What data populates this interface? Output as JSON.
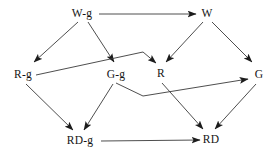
{
  "diagram": {
    "type": "directed-graph",
    "title": "",
    "background_color": "#ffffff",
    "edge_color": "#3a3a3a",
    "text_color": "#141414",
    "nodes": [
      {
        "id": "W-g",
        "label": "W-g",
        "x": 82,
        "y": 14,
        "row": "top"
      },
      {
        "id": "W",
        "label": "W",
        "x": 207,
        "y": 14,
        "row": "top"
      },
      {
        "id": "R-g",
        "label": "R-g",
        "x": 23,
        "y": 75,
        "row": "middle"
      },
      {
        "id": "G-g",
        "label": "G-g",
        "x": 116,
        "y": 75,
        "row": "middle"
      },
      {
        "id": "R",
        "label": "R",
        "x": 161,
        "y": 74,
        "row": "middle"
      },
      {
        "id": "G",
        "label": "G",
        "x": 259,
        "y": 75,
        "row": "middle"
      },
      {
        "id": "RD-g",
        "label": "RD-g",
        "x": 80,
        "y": 141,
        "row": "bottom"
      },
      {
        "id": "RD",
        "label": "RD",
        "x": 211,
        "y": 140,
        "row": "bottom"
      }
    ],
    "edges": [
      {
        "from": "W-g",
        "to": "W",
        "shape": "straight"
      },
      {
        "from": "W-g",
        "to": "R-g",
        "shape": "straight"
      },
      {
        "from": "W-g",
        "to": "G-g",
        "shape": "straight"
      },
      {
        "from": "W",
        "to": "R",
        "shape": "straight"
      },
      {
        "from": "W",
        "to": "G",
        "shape": "straight"
      },
      {
        "from": "R-g",
        "to": "R",
        "shape": "bent-over-peak"
      },
      {
        "from": "G-g",
        "to": "G",
        "shape": "bent-under-valley"
      },
      {
        "from": "R-g",
        "to": "RD-g",
        "shape": "straight"
      },
      {
        "from": "G-g",
        "to": "RD-g",
        "shape": "straight"
      },
      {
        "from": "R",
        "to": "RD",
        "shape": "straight"
      },
      {
        "from": "G",
        "to": "RD",
        "shape": "straight"
      },
      {
        "from": "RD-g",
        "to": "RD",
        "shape": "straight"
      }
    ]
  }
}
